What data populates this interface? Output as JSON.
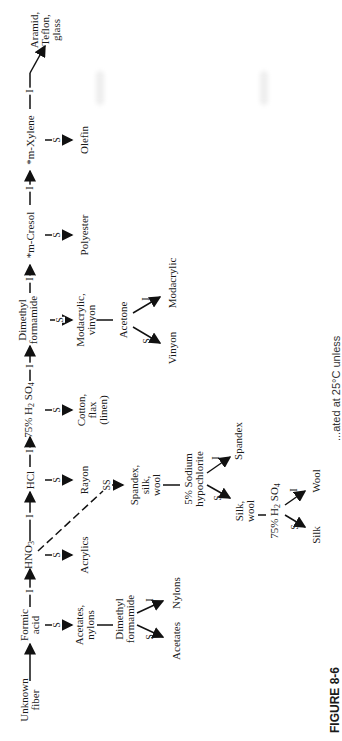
{
  "figure": {
    "label": "FIGURE 8-6",
    "caption_partial": "...ated at 25°C unless"
  },
  "edge_labels": {
    "insoluble": "I",
    "soluble": "S",
    "slightly_soluble": "SS"
  },
  "main_chain": [
    {
      "id": "unknown",
      "line1": "Unknown",
      "line2": "fiber"
    },
    {
      "id": "formic",
      "line1": "Formic",
      "line2": "acid"
    },
    {
      "id": "hno3",
      "text": "HNO",
      "sub": "3"
    },
    {
      "id": "hcl",
      "text": "HCl"
    },
    {
      "id": "h2so4",
      "pre": "75% H",
      "sub1": "2",
      "mid": " SO",
      "sub2": "4"
    },
    {
      "id": "dmf",
      "line1": "Dimethyl",
      "line2": "formamide"
    },
    {
      "id": "mcresol",
      "text": "*m-Cresol"
    },
    {
      "id": "mxylene",
      "text": "*m-Xylene"
    },
    {
      "id": "aramid",
      "line1": "Aramid,",
      "line2": "Teflon,",
      "line3": "glass"
    }
  ],
  "branches": {
    "acetates_nylons": {
      "line1": "Acetates,",
      "line2": "nylons"
    },
    "dmf2": {
      "line1": "Dimethyl",
      "line2": "formamide"
    },
    "acetates": "Acetates",
    "nylons": "Nylons",
    "acrylics": "Acrylics",
    "rayon": "Rayon",
    "cotton": {
      "line1": "Cotton,",
      "line2": "flax",
      "line3": "(linen)"
    },
    "modacrylic_vinyon": {
      "line1": "Modacrylic,",
      "line2": "vinyon"
    },
    "acetone": "Acetone",
    "vinyon": "Vinyon",
    "modacrylic": "Modacrylic",
    "polyester": "Polyester",
    "olefin": "Olefin",
    "spandex_silk_wool": {
      "line1": "Spandex,",
      "line2": "silk,",
      "line3": "wool"
    },
    "hypochlorite": {
      "line1": "5% Sodium",
      "line2": "hypochlorite"
    },
    "spandex": "Spandex",
    "silk_wool": {
      "line1": "Silk,",
      "line2": "wool"
    },
    "h2so4_2": {
      "pre": "75% H",
      "sub1": "2",
      "mid": " SO",
      "sub2": "4"
    },
    "silk": "Silk",
    "wool": "Wool"
  }
}
